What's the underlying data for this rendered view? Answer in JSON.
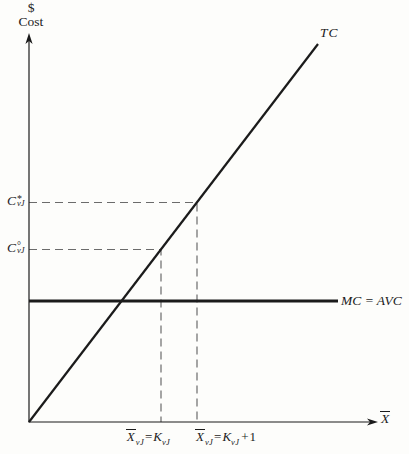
{
  "colors": {
    "ink": "#1b1b1b",
    "dash": "#6b6b6b",
    "background": "#fdfdfb"
  },
  "labels": {
    "dollar": "$",
    "cost": "Cost",
    "tc": "TC",
    "mc_avc": "MC = AVC",
    "c_star": {
      "base": "C",
      "sup": "*",
      "sub": "vJ"
    },
    "c_circ": {
      "base": "C",
      "sup": "°",
      "sub": "vJ"
    },
    "x_mark_1": {
      "xbase": "X",
      "xsub": "vJ",
      "eq": "=",
      "kbase": "K",
      "ksub": "vJ"
    },
    "x_mark_2": {
      "xbase": "X",
      "xsub": "vJ",
      "eq": "=",
      "kbase": "K",
      "ksub": "vJ",
      "suffix": "+1"
    },
    "x_axis_base": "X"
  },
  "chart_data": {
    "type": "line",
    "title": "",
    "xlabel": "X̄",
    "ylabel": "$ Cost",
    "axis_numeric_scale": "none (qualitative textbook diagram)",
    "legend_position": "labels at line ends",
    "grid": false,
    "series": [
      {
        "name": "TC",
        "style": "solid",
        "stroke_width": 2.2,
        "points": [
          [
            29,
            422
          ],
          [
            318,
            44
          ]
        ],
        "description": "Total cost: straight ray from origin rising to upper right"
      },
      {
        "name": "MC = AVC",
        "style": "solid",
        "stroke_width": 3,
        "points": [
          [
            29,
            301
          ],
          [
            338,
            301
          ]
        ],
        "description": "Marginal cost equals average variable cost: horizontal line"
      }
    ],
    "guides": [
      {
        "name": "C*vJ guide at X̄vJ = KvJ + 1",
        "style": "dashed",
        "stroke_width": 1.2,
        "points": [
          [
            29,
            202.5
          ],
          [
            197,
            202.5
          ],
          [
            197,
            422
          ]
        ]
      },
      {
        "name": "C°vJ guide at X̄vJ = KvJ",
        "style": "dashed",
        "stroke_width": 1.2,
        "points": [
          [
            29,
            249.5
          ],
          [
            161,
            249.5
          ],
          [
            161,
            422
          ]
        ]
      }
    ],
    "reference_points": [
      {
        "x_label": "X̄vJ = KvJ",
        "y_label": "C°vJ",
        "on_series": "TC",
        "px": [
          161,
          249.5
        ]
      },
      {
        "x_label": "X̄vJ = KvJ + 1",
        "y_label": "C*vJ",
        "on_series": "TC",
        "px": [
          197,
          202.5
        ]
      }
    ],
    "axes": {
      "y": {
        "line": [
          [
            29,
            40
          ],
          [
            29,
            422
          ]
        ],
        "tip": [
          29,
          33
        ],
        "dir": "up"
      },
      "x": {
        "line": [
          [
            28.4,
            422
          ],
          [
            371,
            422
          ]
        ],
        "tip": [
          378,
          422
        ],
        "dir": "right"
      }
    }
  }
}
